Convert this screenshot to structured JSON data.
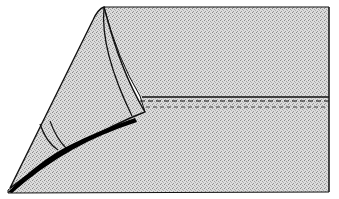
{
  "figure": {
    "colors": {
      "background": "#ffffff",
      "fabric": "#c8c8c8",
      "fabric_light": "#e2e2e2",
      "outline": "#111111",
      "shadow": "#000000"
    },
    "parts": {
      "panel": "fabric-panel",
      "flap": "folded-flap",
      "seam": "stitched-seam",
      "fold_shadow": "fold-shadow-band"
    }
  }
}
